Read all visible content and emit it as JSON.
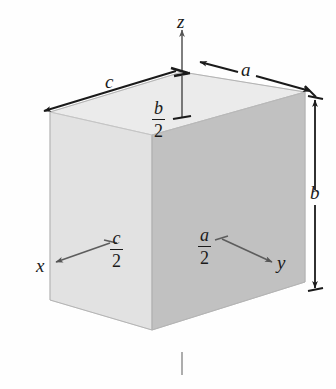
{
  "figure": {
    "axes": [
      {
        "name": "z",
        "label": "z",
        "direction": "up"
      },
      {
        "name": "x",
        "label": "x",
        "direction": "down-left"
      },
      {
        "name": "y",
        "label": "y",
        "direction": "down-right"
      }
    ],
    "dimensions": [
      {
        "name": "c",
        "label": "c",
        "kind": "plain",
        "edge": "top-left-depth"
      },
      {
        "name": "a",
        "label": "a",
        "kind": "plain",
        "edge": "top-right-width"
      },
      {
        "name": "b",
        "label": "b",
        "kind": "plain",
        "edge": "right-height"
      }
    ],
    "half_dimensions": [
      {
        "name": "b-over-2",
        "numerator": "b",
        "denominator": "2",
        "edge": "vertical-center-top"
      },
      {
        "name": "c-over-2",
        "numerator": "c",
        "denominator": "2",
        "edge": "x-axis-half"
      },
      {
        "name": "a-over-2",
        "numerator": "a",
        "denominator": "2",
        "edge": "y-axis-half"
      }
    ],
    "colors": {
      "top_face": "#ebebeb",
      "left_face": "#e0e0e0",
      "right_face": "#c8c8c8",
      "stroke": "#1a1a1a",
      "axis_gray": "#555555",
      "background": "#fefefe"
    },
    "bleed_text": [
      "on of centro",
      "geometrical cen"
    ]
  }
}
